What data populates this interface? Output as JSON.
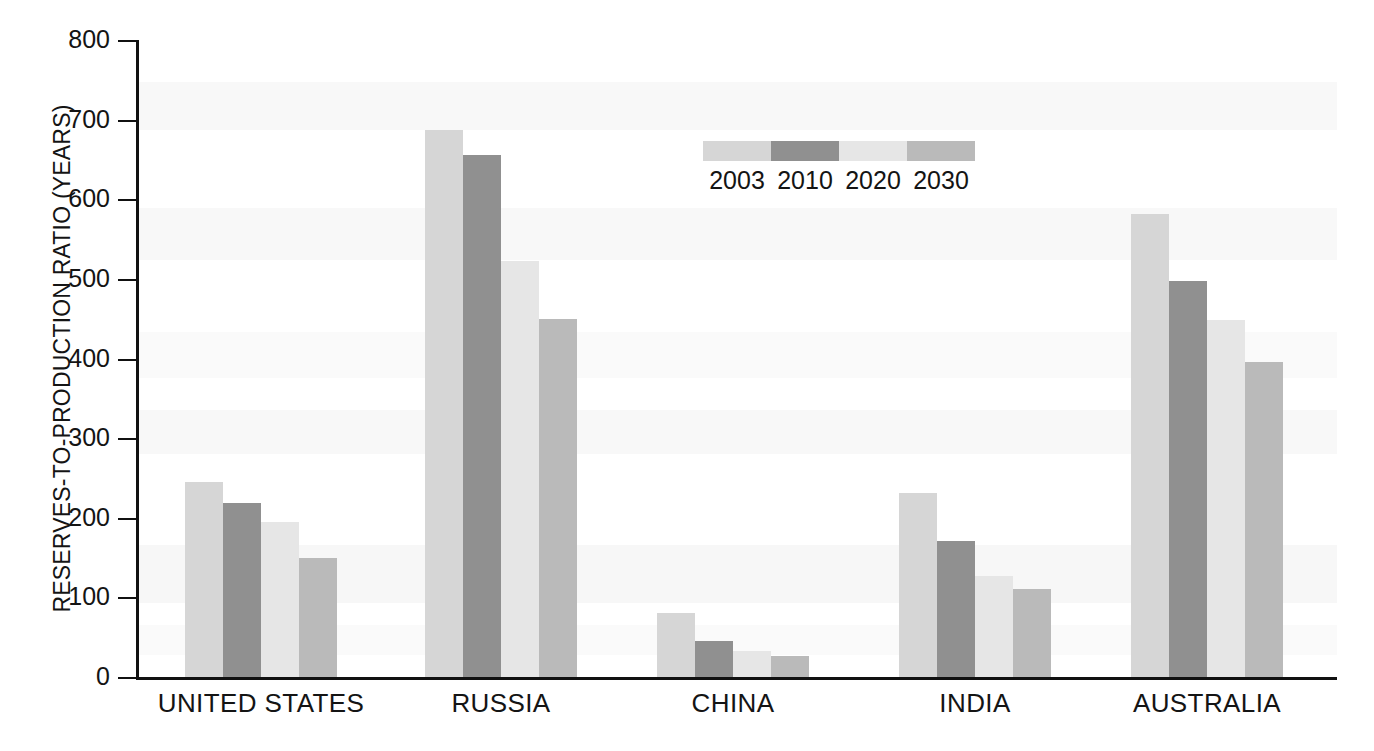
{
  "chart_data": {
    "type": "bar",
    "title": "",
    "subtitle": "",
    "xlabel": "",
    "ylabel": "RESERVES-TO-PRODUCTION RATIO (YEARS)",
    "categories": [
      "UNITED STATES",
      "RUSSIA",
      "CHINA",
      "INDIA",
      "AUSTRALIA"
    ],
    "series": [
      {
        "name": "2003",
        "color": "#d6d6d6",
        "values": [
          245,
          687,
          80,
          231,
          582
        ]
      },
      {
        "name": "2010",
        "color": "#909090",
        "values": [
          218,
          655,
          45,
          171,
          497
        ]
      },
      {
        "name": "2020",
        "color": "#e6e6e6",
        "values": [
          195,
          522,
          33,
          127,
          448
        ]
      },
      {
        "name": "2030",
        "color": "#bababa",
        "values": [
          150,
          450,
          26,
          110,
          395
        ]
      }
    ],
    "ylim": [
      0,
      800
    ],
    "ytick_values": [
      0,
      100,
      200,
      300,
      400,
      500,
      600,
      700,
      800
    ],
    "ytick_labels": [
      "0",
      "100",
      "200",
      "300",
      "400",
      "500",
      "600",
      "700",
      "800"
    ],
    "grid": false,
    "legend_position": "top-center",
    "legend_entries": [
      "2003",
      "2010",
      "2020",
      "2030"
    ],
    "annotations": []
  },
  "axis": {
    "y_title": "RESERVES-TO-PRODUCTION RATIO (YEARS)"
  },
  "legend": {
    "entries": [
      {
        "label": "2003",
        "color": "#d6d6d6"
      },
      {
        "label": "2010",
        "color": "#909090"
      },
      {
        "label": "2020",
        "color": "#e6e6e6"
      },
      {
        "label": "2030",
        "color": "#bababa"
      }
    ]
  },
  "colors": {
    "axis": "#111111",
    "text": "#141414",
    "background": "#ffffff",
    "band": "#f2f2f2"
  }
}
